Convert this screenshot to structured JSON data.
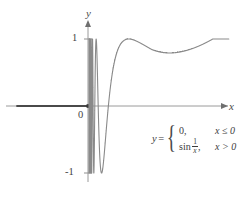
{
  "figure": {
    "axes": {
      "x_label": "x",
      "y_label": "y",
      "origin_label": "0",
      "y_tick_top": "1",
      "y_tick_bottom": "-1"
    },
    "equation": {
      "lhs": "y",
      "equals": "=",
      "case_1_expr": "0,",
      "case_1_cond": "x ≤ 0",
      "case_2_fn": "sin",
      "case_2_numer": "1",
      "case_2_denom": "x",
      "case_2_comma": ",",
      "case_2_cond": "x > 0"
    }
  },
  "chart_data": {
    "type": "line",
    "xlabel": "x",
    "ylabel": "y",
    "xlim": [
      -1.32,
      2.2
    ],
    "ylim": [
      -1.45,
      1.45
    ],
    "grid": false,
    "legend": null,
    "y_ticks": [
      -1,
      1
    ],
    "y_tick_labels": [
      "-1",
      "1"
    ],
    "x_ticks": [
      0
    ],
    "x_tick_labels": [
      "0"
    ],
    "annotations": [
      {
        "text": "y = { 0, x ≤ 0 ; sin(1/x), x > 0 }",
        "x": 0.96,
        "y": -0.45
      }
    ],
    "series": [
      {
        "name": "y = 0 for x ≤ 0",
        "type": "line",
        "color": "#4a4a4a",
        "linewidth": 2.2,
        "x": [
          -1.32,
          0
        ],
        "values": [
          0,
          0
        ]
      },
      {
        "name": "y = sin(1/x) for x > 0",
        "type": "line",
        "color": "#8a8a8a",
        "linewidth": 1.1,
        "description": "Oscillates infinitely fast near x=0 with amplitude 1, oscillations widen as x increases, last trough near x=0.52 reaching -1, then rises through zero near x=0.9 and asymptotes to 1 as x grows large.",
        "sampled_points": [
          {
            "x": 0.02,
            "y": -0.262
          },
          {
            "x": 0.045,
            "y": 0.951
          },
          {
            "x": 0.06,
            "y": -0.428
          },
          {
            "x": 0.075,
            "y": 0.041
          },
          {
            "x": 0.09,
            "y": 0.482
          },
          {
            "x": 0.106,
            "y": 1.0
          },
          {
            "x": 0.13,
            "y": 0.193
          },
          {
            "x": 0.16,
            "y": -1.0
          },
          {
            "x": 0.2,
            "y": -0.959
          },
          {
            "x": 0.25,
            "y": -0.757
          },
          {
            "x": 0.3,
            "y": 0.19
          },
          {
            "x": 0.35,
            "y": 0.999
          },
          {
            "x": 0.4,
            "y": 0.598
          },
          {
            "x": 0.45,
            "y": -0.108
          },
          {
            "x": 0.52,
            "y": -1.0
          },
          {
            "x": 0.6,
            "y": -0.995
          },
          {
            "x": 0.7,
            "y": -0.859
          },
          {
            "x": 0.8,
            "y": -0.661
          },
          {
            "x": 0.9,
            "y": -0.473
          },
          {
            "x": 1.0,
            "y": 0.841
          },
          {
            "x": 1.2,
            "y": 0.741
          },
          {
            "x": 1.5,
            "y": 0.618
          },
          {
            "x": 2.0,
            "y": 0.479
          }
        ]
      }
    ],
    "asymptote_note": "y → 1 as x → ∞ (visually the right branch flattens at y = 1)"
  }
}
